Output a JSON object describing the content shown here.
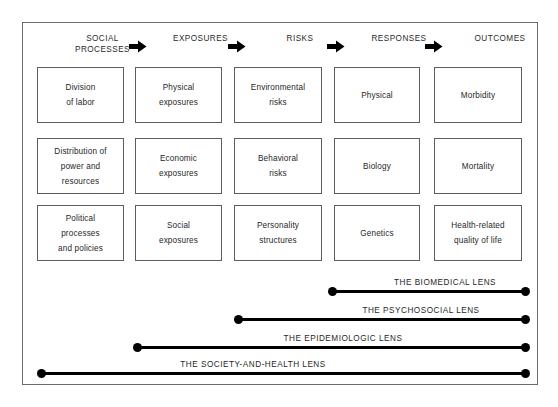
{
  "figure": {
    "columns": [
      {
        "header": "SOCIAL\nPROCESSES"
      },
      {
        "header": "EXPOSURES"
      },
      {
        "header": "RISKS"
      },
      {
        "header": "RESPONSES"
      },
      {
        "header": "OUTCOMES"
      }
    ],
    "arrow_icon": "right-arrow-icon",
    "rows": [
      [
        "Division\nof labor",
        "Physical\nexposures",
        "Environmental\nrisks",
        "Physical",
        "Morbidity"
      ],
      [
        "Distribution of\npower and\nresources",
        "Economic\nexposures",
        "Behavioral\nrisks",
        "Biology",
        "Mortality"
      ],
      [
        "Political\nprocesses\nand policies",
        "Social\nexposures",
        "Personality\nstructures",
        "Genetics",
        "Health-related\nquality of life"
      ]
    ],
    "lenses": [
      {
        "label": "THE BIOMEDICAL LENS"
      },
      {
        "label": "THE PSYCHOSOCIAL LENS"
      },
      {
        "label": "THE EPIDEMIOLOGIC LENS"
      },
      {
        "label": "THE SOCIETY-AND-HEALTH LENS"
      }
    ],
    "colors": {
      "frame_border": "#6b6b6b",
      "box_border": "#5d5d5d",
      "line": "#000000",
      "text": "#1f1f1f",
      "background": "#ffffff"
    }
  }
}
